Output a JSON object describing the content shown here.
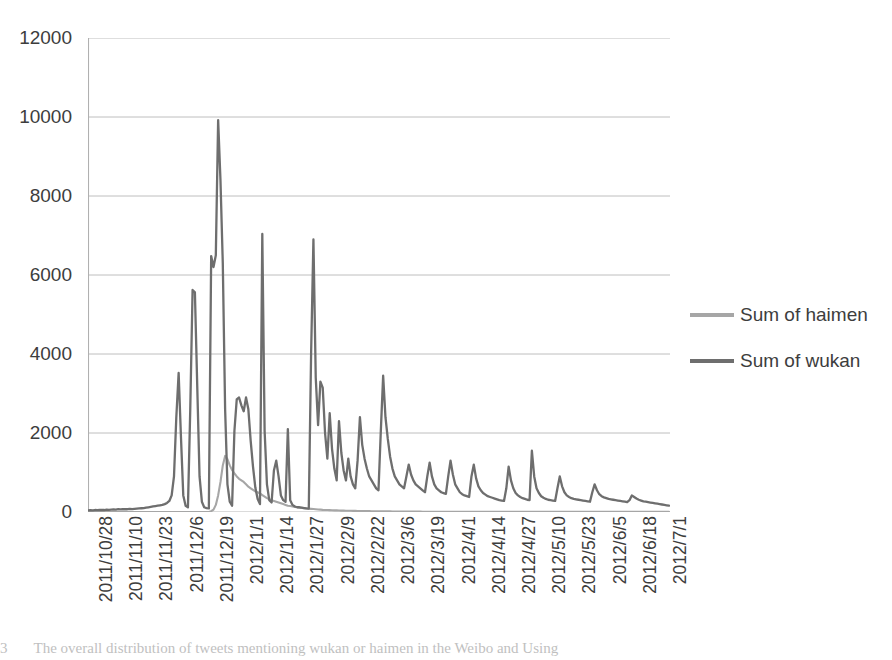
{
  "figure": {
    "caption_number": "3",
    "caption_text": "The overall distribution of tweets mentioning wukan or haimen in the Weibo and Using"
  },
  "legend": {
    "position": "right",
    "entries": [
      {
        "label": "Sum of haimen",
        "color": "#a6a6a6"
      },
      {
        "label": "Sum of wukan",
        "color": "#6e6e6e"
      }
    ]
  },
  "axes": {
    "y_ticks": [
      "0",
      "2000",
      "4000",
      "6000",
      "8000",
      "10000",
      "12000"
    ],
    "x_ticks": [
      "2011/10/28",
      "2011/11/10",
      "2011/11/23",
      "2011/12/6",
      "2011/12/19",
      "2012/1/1",
      "2012/1/14",
      "2012/1/27",
      "2012/2/9",
      "2012/2/22",
      "2012/3/6",
      "2012/3/19",
      "2012/4/1",
      "2012/4/14",
      "2012/4/27",
      "2012/5/10",
      "2012/5/23",
      "2012/6/5",
      "2012/6/18",
      "2012/7/1"
    ]
  },
  "chart_data": {
    "type": "line",
    "title": "",
    "xlabel": "",
    "ylabel": "",
    "ylim": [
      0,
      12000
    ],
    "ytick_step": 2000,
    "grid": true,
    "legend_position": "right",
    "x_tick_labels": [
      "2011/10/28",
      "2011/11/10",
      "2011/11/23",
      "2011/12/6",
      "2011/12/19",
      "2012/1/1",
      "2012/1/14",
      "2012/1/27",
      "2012/2/9",
      "2012/2/22",
      "2012/3/6",
      "2012/3/19",
      "2012/4/1",
      "2012/4/14",
      "2012/4/27",
      "2012/5/10",
      "2012/5/23",
      "2012/6/5",
      "2012/6/18",
      "2012/7/1"
    ],
    "x_tick_interval_days": 13,
    "x_start": "2011/10/28",
    "x_end": "2012/7/4",
    "n_points": 251,
    "series": [
      {
        "name": "Sum of haimen",
        "color": "#a6a6a6",
        "values": [
          0,
          0,
          0,
          0,
          0,
          0,
          0,
          0,
          0,
          0,
          0,
          0,
          0,
          0,
          0,
          0,
          0,
          0,
          0,
          0,
          0,
          0,
          0,
          0,
          0,
          0,
          0,
          0,
          0,
          0,
          0,
          0,
          0,
          0,
          0,
          0,
          0,
          0,
          0,
          0,
          0,
          0,
          0,
          0,
          0,
          0,
          0,
          0,
          0,
          0,
          0,
          0,
          0,
          20,
          60,
          180,
          420,
          760,
          1180,
          1420,
          1340,
          1180,
          1060,
          980,
          900,
          840,
          800,
          760,
          700,
          640,
          600,
          560,
          520,
          500,
          470,
          430,
          390,
          350,
          320,
          300,
          280,
          260,
          240,
          220,
          200,
          180,
          160,
          150,
          140,
          130,
          120,
          110,
          100,
          95,
          90,
          85,
          80,
          75,
          70,
          65,
          60,
          55,
          52,
          50,
          48,
          45,
          42,
          40,
          38,
          36,
          34,
          32,
          30,
          30,
          28,
          28,
          26,
          26,
          24,
          24,
          22,
          22,
          20,
          20,
          20,
          18,
          18,
          18,
          16,
          16,
          16,
          14,
          14,
          14,
          12,
          12,
          12,
          12,
          10,
          10,
          10,
          10,
          10,
          10,
          8,
          8,
          8,
          8,
          8,
          8,
          8,
          6,
          6,
          6,
          6,
          6,
          6,
          6,
          6,
          6,
          6,
          6,
          6,
          6,
          6,
          6,
          4,
          4,
          4,
          4,
          4,
          4,
          4,
          4,
          4,
          4,
          4,
          4,
          4,
          4,
          4,
          4,
          4,
          4,
          4,
          4,
          4,
          4,
          4,
          4,
          4,
          4,
          4,
          4,
          4,
          4,
          4,
          4,
          4,
          4,
          4,
          4,
          4,
          4,
          4,
          4,
          4,
          4,
          4,
          4,
          4,
          4,
          4,
          4,
          4,
          4,
          4,
          4,
          4,
          4,
          4,
          4,
          4,
          4,
          4,
          4,
          4,
          4,
          4,
          4,
          4,
          4,
          4,
          4,
          4,
          4,
          4,
          4,
          4,
          4,
          4,
          4,
          4,
          4,
          4,
          4,
          4,
          4,
          4,
          4,
          4
        ]
      },
      {
        "name": "Sum of wukan",
        "color": "#6e6e6e",
        "values": [
          40,
          45,
          40,
          50,
          45,
          50,
          55,
          50,
          60,
          55,
          60,
          65,
          60,
          70,
          65,
          70,
          75,
          70,
          80,
          75,
          80,
          85,
          90,
          95,
          100,
          110,
          120,
          130,
          140,
          150,
          160,
          170,
          180,
          200,
          230,
          280,
          420,
          900,
          2400,
          3520,
          1900,
          420,
          160,
          120,
          2600,
          5620,
          5560,
          3200,
          900,
          260,
          120,
          100,
          90,
          6480,
          6200,
          6500,
          9920,
          8400,
          6300,
          2600,
          700,
          260,
          160,
          2050,
          2850,
          2900,
          2700,
          2550,
          2900,
          2600,
          1800,
          1150,
          620,
          330,
          200,
          7040,
          2050,
          700,
          300,
          240,
          1050,
          1300,
          900,
          420,
          300,
          260,
          2100,
          300,
          180,
          140,
          120,
          120,
          110,
          100,
          90,
          85,
          4000,
          6900,
          3400,
          2200,
          3300,
          3150,
          2000,
          1350,
          2500,
          1600,
          1100,
          800,
          2300,
          1500,
          1050,
          800,
          1350,
          900,
          700,
          600,
          1300,
          2400,
          1700,
          1350,
          1100,
          900,
          800,
          700,
          600,
          550,
          2050,
          3450,
          2400,
          1850,
          1400,
          1100,
          900,
          800,
          700,
          650,
          600,
          900,
          1200,
          950,
          800,
          700,
          650,
          600,
          550,
          500,
          900,
          1250,
          900,
          700,
          600,
          550,
          500,
          480,
          460,
          900,
          1300,
          950,
          700,
          600,
          500,
          450,
          420,
          400,
          380,
          900,
          1200,
          850,
          650,
          550,
          480,
          440,
          400,
          380,
          360,
          340,
          320,
          300,
          290,
          280,
          600,
          1150,
          800,
          600,
          480,
          420,
          380,
          350,
          330,
          310,
          300,
          1550,
          900,
          600,
          480,
          400,
          360,
          330,
          310,
          300,
          290,
          280,
          600,
          900,
          650,
          500,
          420,
          380,
          350,
          330,
          320,
          310,
          300,
          290,
          280,
          270,
          260,
          500,
          700,
          550,
          450,
          400,
          370,
          350,
          330,
          320,
          310,
          300,
          290,
          280,
          270,
          260,
          250,
          300,
          420,
          380,
          340,
          310,
          290,
          270,
          260,
          250,
          240,
          230,
          220,
          210,
          200,
          190,
          180,
          170,
          160
        ]
      }
    ]
  }
}
